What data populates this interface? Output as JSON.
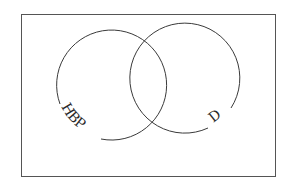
{
  "diagram": {
    "type": "venn",
    "sets": [
      {
        "label": "HBP",
        "cx": 110,
        "cy": 82,
        "r": 55
      },
      {
        "label": "D",
        "cx": 182,
        "cy": 82,
        "r": 55
      }
    ],
    "frame": {
      "x": 21,
      "y": 14,
      "width": 254,
      "height": 162
    },
    "stroke_color": "#3a3a3a"
  }
}
